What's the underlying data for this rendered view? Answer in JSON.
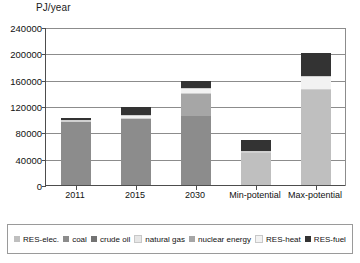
{
  "chart_data": {
    "type": "bar",
    "subtype": "stacked",
    "title": "",
    "ylabel": "PJ/year",
    "xlabel": "",
    "ylim": [
      0,
      240000
    ],
    "yticks": [
      0,
      40000,
      80000,
      120000,
      160000,
      200000,
      240000
    ],
    "ytick_labels": [
      "0",
      "40000",
      "80000",
      "120000",
      "160000",
      "200000",
      "240000"
    ],
    "grid": true,
    "legend_position": "bottom",
    "categories": [
      "2011",
      "2015",
      "2030",
      "Min-potential",
      "Max-potential"
    ],
    "series": [
      {
        "name": "RES-elec.",
        "color": "#bfbfbf",
        "values": [
          0,
          0,
          0,
          48000,
          145000
        ]
      },
      {
        "name": "coal",
        "color": "#8c8c8c",
        "values": [
          95000,
          101000,
          105000,
          0,
          0
        ]
      },
      {
        "name": "crude oil",
        "color": "#737373",
        "values": [
          0,
          0,
          0,
          0,
          0
        ]
      },
      {
        "name": "natural gas",
        "color": "#e6e6e6",
        "values": [
          0,
          0,
          0,
          0,
          0
        ]
      },
      {
        "name": "nuclear energy",
        "color": "#a6a6a6",
        "values": [
          0,
          0,
          33000,
          0,
          0
        ]
      },
      {
        "name": "RES-heat",
        "color": "#f2f2f2",
        "values": [
          4000,
          6000,
          9000,
          3000,
          21000
        ]
      },
      {
        "name": "RES-fuel",
        "color": "#333333",
        "values": [
          3000,
          12000,
          11000,
          17000,
          34000
        ]
      }
    ],
    "totals": [
      102000,
      119000,
      158000,
      68000,
      200000
    ]
  },
  "axis": {
    "y_title": "PJ/year"
  },
  "legend": {
    "items": [
      {
        "label": "RES-elec.",
        "color": "#bfbfbf"
      },
      {
        "label": "coal",
        "color": "#8c8c8c"
      },
      {
        "label": "crude oil",
        "color": "#737373"
      },
      {
        "label": "natural gas",
        "color": "#e6e6e6"
      },
      {
        "label": "nuclear energy",
        "color": "#a6a6a6"
      },
      {
        "label": "RES-heat",
        "color": "#f2f2f2"
      },
      {
        "label": "RES-fuel",
        "color": "#333333"
      }
    ]
  }
}
